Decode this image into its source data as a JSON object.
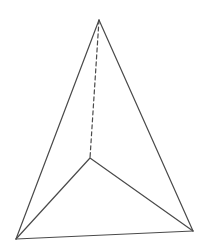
{
  "diagram": {
    "type": "tetrahedron",
    "stroke_color": "#4a4a4a",
    "background": "#ffffff",
    "vertices": {
      "apex": [
        99,
        20
      ],
      "bottom_left": [
        16,
        239
      ],
      "bottom_right": [
        193,
        231
      ],
      "inner": [
        90,
        158
      ]
    },
    "edges": [
      {
        "from": "apex",
        "to": "bottom_left",
        "style": "solid"
      },
      {
        "from": "apex",
        "to": "bottom_right",
        "style": "solid"
      },
      {
        "from": "bottom_left",
        "to": "bottom_right",
        "style": "solid"
      },
      {
        "from": "inner",
        "to": "bottom_left",
        "style": "solid"
      },
      {
        "from": "inner",
        "to": "bottom_right",
        "style": "solid"
      },
      {
        "from": "apex",
        "to": "inner",
        "style": "dashed"
      }
    ]
  }
}
